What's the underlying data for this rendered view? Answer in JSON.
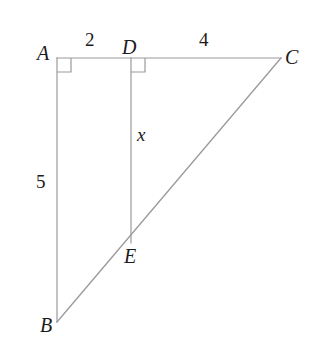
{
  "figure": {
    "kind": "geometry-diagram",
    "width": 314,
    "height": 340,
    "background_color": "#ffffff",
    "line_color": "#9a9a9a",
    "label_color": "#1b1b1b"
  },
  "vertices": [
    {
      "id": "A",
      "label": "A",
      "x": 57,
      "y": 58,
      "label_x": 37,
      "label_y": 43
    },
    {
      "id": "D",
      "label": "D",
      "x": 131,
      "y": 58,
      "label_x": 122,
      "label_y": 37
    },
    {
      "id": "C",
      "label": "C",
      "x": 281,
      "y": 58,
      "label_x": 285,
      "label_y": 47
    },
    {
      "id": "B",
      "label": "B",
      "x": 57,
      "y": 322,
      "label_x": 40,
      "label_y": 315
    },
    {
      "id": "E",
      "label": "E",
      "x": 131,
      "y": 243,
      "label_x": 124,
      "label_y": 246
    }
  ],
  "segments": [
    {
      "id": "AC",
      "from": "A",
      "to": "C"
    },
    {
      "id": "AB",
      "from": "A",
      "to": "B"
    },
    {
      "id": "BC",
      "from": "B",
      "to": "C"
    },
    {
      "id": "DE",
      "from": "D",
      "to": "E"
    }
  ],
  "right_angles": [
    {
      "id": "angle-A",
      "at": "A",
      "size": 14,
      "dir_x": 1,
      "dir_y": 1
    },
    {
      "id": "angle-D",
      "at": "D",
      "size": 14,
      "dir_x": 1,
      "dir_y": 1
    }
  ],
  "measures": [
    {
      "id": "AD",
      "text": "2",
      "x": 85,
      "y": 30,
      "style": "measure"
    },
    {
      "id": "DC",
      "text": "4",
      "x": 199,
      "y": 30,
      "style": "measure"
    },
    {
      "id": "AB",
      "text": "5",
      "x": 36,
      "y": 172,
      "style": "measure"
    },
    {
      "id": "DE",
      "text": "x",
      "x": 137,
      "y": 125,
      "style": "variable"
    }
  ],
  "labels": {
    "vertex_a": "A",
    "vertex_b": "B",
    "vertex_c": "C",
    "vertex_d": "D",
    "vertex_e": "E",
    "length_ad": "2",
    "length_dc": "4",
    "length_ab": "5",
    "length_de": "x"
  }
}
